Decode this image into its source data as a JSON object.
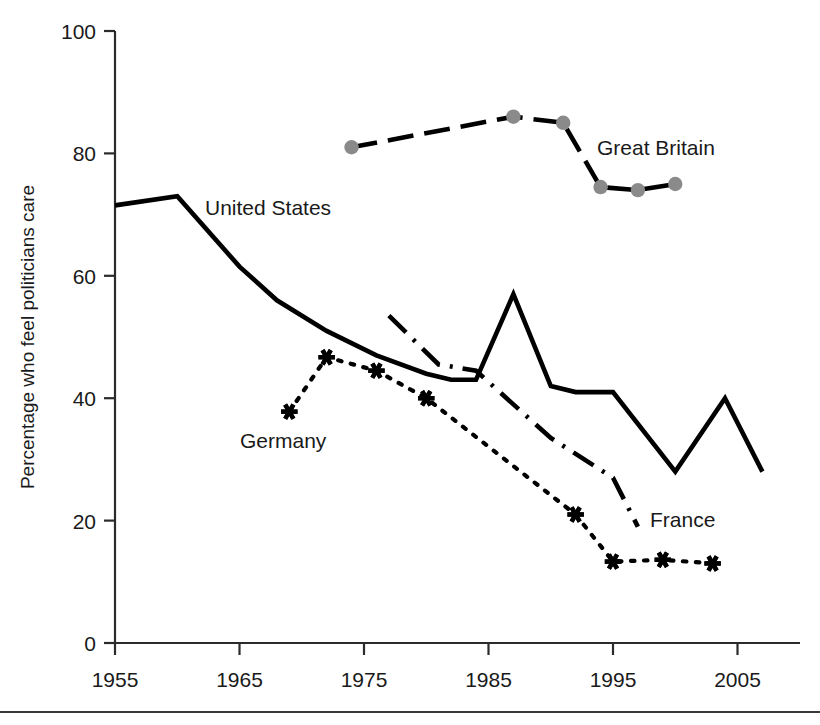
{
  "chart_data": {
    "type": "line",
    "title": "",
    "xlabel": "",
    "ylabel": "Percentage who feel politicians care",
    "xlim": [
      1955,
      2008
    ],
    "ylim": [
      0,
      100
    ],
    "xticks": [
      1955,
      1965,
      1975,
      1985,
      1995,
      2005
    ],
    "xticklabels": [
      "1955",
      "1965",
      "1975",
      "1985",
      "1995",
      "2005"
    ],
    "yticks": [
      0,
      20,
      40,
      60,
      80,
      100
    ],
    "yticklabels": [
      "0",
      "20",
      "40",
      "60",
      "80",
      "100"
    ],
    "grid": false,
    "legend_position": "inline-annotations",
    "series": [
      {
        "name": "United States",
        "style": "solid",
        "color": "#000000",
        "marker": "none",
        "label_position": {
          "x": 205,
          "y": 215
        },
        "x": [
          1955,
          1960,
          1965,
          1968,
          1972,
          1976,
          1980,
          1982,
          1984,
          1987,
          1990,
          1992,
          1995,
          2000,
          2004,
          2007
        ],
        "y": [
          71.5,
          73,
          61.5,
          56,
          51,
          47,
          44,
          43,
          43,
          57,
          42,
          41,
          41,
          28,
          40,
          28
        ]
      },
      {
        "name": "Great Britain",
        "style": "dashed",
        "color": "#000000",
        "marker": "circle",
        "marker_color": "#8a8a8a",
        "label_position": {
          "x": 597,
          "y": 155
        },
        "x": [
          1974,
          1987,
          1991,
          1994,
          1997,
          2000
        ],
        "y": [
          81,
          86,
          85,
          74.5,
          74,
          75
        ]
      },
      {
        "name": "Germany",
        "style": "dotted",
        "color": "#000000",
        "marker": "star",
        "label_position": {
          "x": 240,
          "y": 448
        },
        "x": [
          1969,
          1972,
          1976,
          1980,
          1992,
          1995,
          1999,
          2003
        ],
        "y": [
          37.8,
          46.7,
          44.5,
          40,
          21,
          13.3,
          13.6,
          13
        ]
      },
      {
        "name": "France",
        "style": "dashdot",
        "color": "#000000",
        "marker": "none",
        "label_position": {
          "x": 650,
          "y": 527
        },
        "x": [
          1977,
          1981,
          1984,
          1990,
          1995,
          1997
        ],
        "y": [
          53.5,
          45.5,
          44.5,
          33.5,
          27,
          19
        ]
      }
    ]
  },
  "axis": {
    "y_axis_title": "Percentage who feel politicians care"
  },
  "labels": {
    "united_states": "United States",
    "great_britain": "Great Britain",
    "germany": "Germany",
    "france": "France"
  }
}
